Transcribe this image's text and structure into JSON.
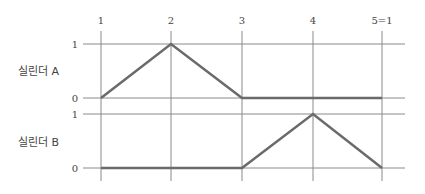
{
  "diagram": {
    "type": "displacement-step-diagram",
    "steps": [
      "1",
      "2",
      "3",
      "4",
      "5=1"
    ],
    "colors": {
      "grid": "#8a8a8a",
      "trace": "#6a6a6a",
      "text": "#444444"
    },
    "cylinders": [
      {
        "name": "실린더 A",
        "level_labels": {
          "high": "1",
          "low": "0"
        },
        "positions": [
          0,
          1,
          0,
          0,
          0
        ]
      },
      {
        "name": "실린더 B",
        "level_labels": {
          "high": "1",
          "low": "0"
        },
        "positions": [
          0,
          0,
          0,
          1,
          0
        ]
      }
    ]
  }
}
